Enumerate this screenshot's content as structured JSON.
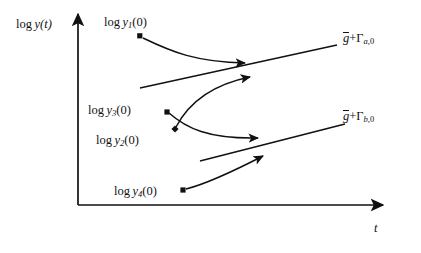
{
  "figure": {
    "domain": "diagram",
    "background_color": "#ffffff",
    "ink_color": "#111111"
  },
  "axes": {
    "y_label": "log y(t)",
    "y_label_parts": {
      "log": "log",
      "var": "y",
      "arg": "(t)"
    },
    "x_label": "t",
    "x_axis": {
      "x_start": 78,
      "x_end": 385,
      "y": 205,
      "arrow": "right"
    },
    "y_axis": {
      "x": 78,
      "y_start": 205,
      "y_end": 12,
      "arrow": "up"
    },
    "ticks": "none",
    "grid": "off"
  },
  "initial_conditions": [
    {
      "id": "y1",
      "label": "log y_1(0)",
      "label_parts": {
        "log": "log",
        "var": "y",
        "sub": "1",
        "arg": "(0)"
      },
      "marker": "square",
      "marker_point": [
        140,
        36
      ]
    },
    {
      "id": "y3",
      "label": "log y_3(0)",
      "label_parts": {
        "log": "log",
        "var": "y",
        "sub": "3",
        "arg": "(0)"
      },
      "marker": "square",
      "marker_point": [
        167,
        112
      ]
    },
    {
      "id": "y2",
      "label": "log y_2(0)",
      "label_parts": {
        "log": "log",
        "var": "y",
        "sub": "2",
        "arg": "(0)"
      },
      "marker": "diamond",
      "marker_point": [
        175,
        129
      ]
    },
    {
      "id": "y4",
      "label": "log y_4(0)",
      "label_parts": {
        "log": "log",
        "var": "y",
        "sub": "4",
        "arg": "(0)"
      },
      "marker": "square",
      "marker_point": [
        183,
        190
      ]
    }
  ],
  "attractors": [
    {
      "id": "attractor_a",
      "label": "g̃ + Γ_a,0",
      "label_parts": {
        "gsym": "g",
        "plus": "+",
        "gamma": "Γ",
        "sub_letter": "a",
        "sub_index": "0"
      },
      "trunk_line": {
        "from": [
          140,
          88
        ],
        "to": [
          337,
          45
        ]
      }
    },
    {
      "id": "attractor_b",
      "label": "g̃ + Γ_b,0",
      "label_parts": {
        "gsym": "g",
        "plus": "+",
        "gamma": "Γ",
        "sub_letter": "b",
        "sub_index": "0"
      },
      "trunk_line": {
        "from": [
          200,
          161
        ],
        "to": [
          345,
          124
        ]
      }
    }
  ],
  "trajectories": [
    {
      "id": "traj_y1_to_a",
      "from": "y1",
      "to": "attractor_a",
      "direction": "descending",
      "arrow_tip": [
        247,
        63
      ]
    },
    {
      "id": "traj_y2_to_a",
      "from": "y2",
      "to": "attractor_a",
      "direction": "ascending",
      "arrow_tip": [
        252,
        77
      ]
    },
    {
      "id": "traj_y3_to_b",
      "from": "y3",
      "to": "attractor_b",
      "direction": "descending",
      "arrow_tip": [
        260,
        138
      ]
    },
    {
      "id": "traj_y4_to_b",
      "from": "y4",
      "to": "attractor_b",
      "direction": "ascending",
      "arrow_tip": [
        265,
        156
      ]
    }
  ]
}
